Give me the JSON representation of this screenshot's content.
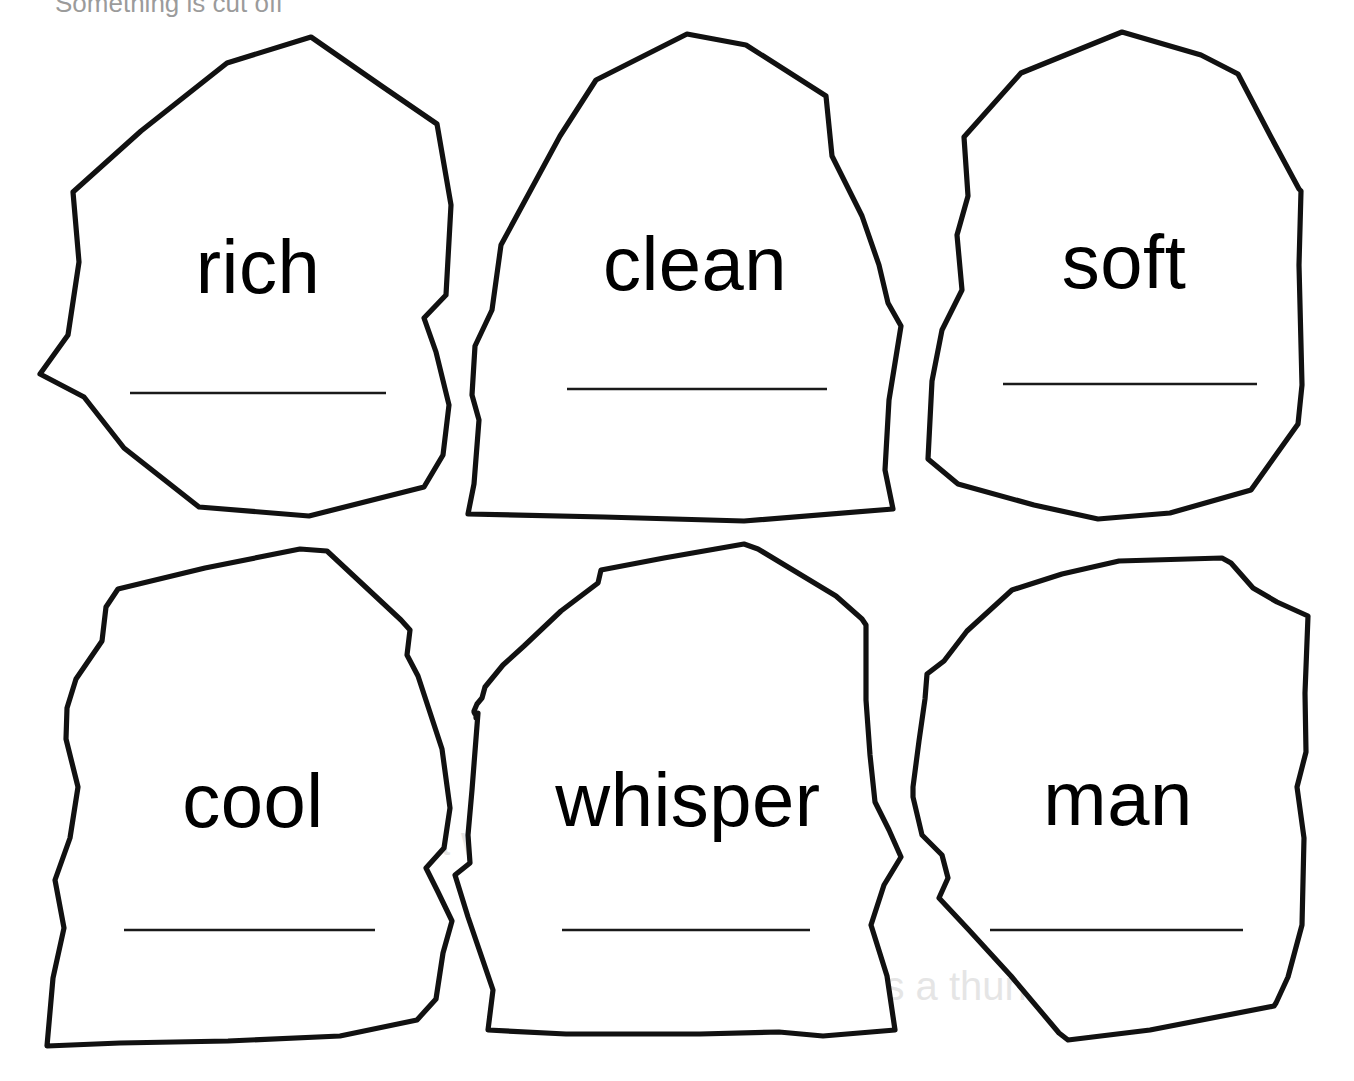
{
  "page": {
    "background_color": "#ffffff",
    "ink_color": "#111111",
    "width": 1354,
    "height": 1081,
    "header_fragment": "Something is cut off"
  },
  "cards": [
    {
      "id": "card-rich",
      "word": "rich",
      "row": 1,
      "column": 1,
      "has_answer_line": true,
      "answer_line_value": ""
    },
    {
      "id": "card-clean",
      "word": "clean",
      "row": 1,
      "column": 2,
      "has_answer_line": true,
      "answer_line_value": ""
    },
    {
      "id": "card-soft",
      "word": "soft",
      "row": 1,
      "column": 3,
      "has_answer_line": true,
      "answer_line_value": ""
    },
    {
      "id": "card-cool",
      "word": "cool",
      "row": 2,
      "column": 1,
      "has_answer_line": true,
      "answer_line_value": ""
    },
    {
      "id": "card-whisper",
      "word": "whisper",
      "row": 2,
      "column": 2,
      "has_answer_line": true,
      "answer_line_value": ""
    },
    {
      "id": "card-man",
      "word": "man",
      "row": 2,
      "column": 3,
      "has_answer_line": true,
      "answer_line_value": ""
    }
  ],
  "ghost_bleed_text": {
    "line_one": "a wonderful comparison",
    "line_two": "as loud as a thunderclap"
  }
}
